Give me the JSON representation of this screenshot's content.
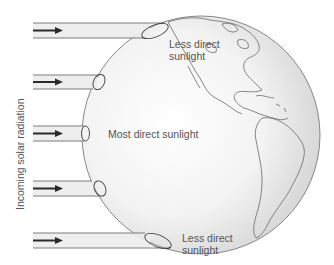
{
  "diagram": {
    "axis_label": "Incoming solar radiation",
    "labels": {
      "top": [
        "Less direct",
        "sunlight"
      ],
      "middle": "Most direct sunlight",
      "bottom": [
        "Less direct",
        "sunlight"
      ]
    },
    "rays": [
      {
        "id": 1,
        "y_top": 23,
        "y_bottom": 38,
        "end_x": 150,
        "spot": "elongated"
      },
      {
        "id": 2,
        "y_top": 75,
        "y_bottom": 89,
        "end_x": 97,
        "spot": "slightly-oval"
      },
      {
        "id": 3,
        "y_top": 126,
        "y_bottom": 141,
        "end_x": 84,
        "spot": "circular"
      },
      {
        "id": 4,
        "y_top": 181,
        "y_bottom": 196,
        "end_x": 97,
        "spot": "slightly-oval"
      },
      {
        "id": 5,
        "y_top": 233,
        "y_bottom": 248,
        "end_x": 150,
        "spot": "elongated"
      }
    ],
    "colors": {
      "band_fill": "#ececec",
      "band_line": "#6e6e6e",
      "arrow": "#2a2a2a",
      "globe_edge": "#7a7a7a",
      "text": "#555555"
    }
  }
}
